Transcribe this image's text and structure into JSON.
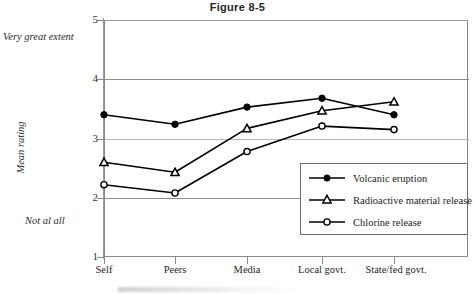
{
  "figure": {
    "title": "Figure 8-5"
  },
  "axes": {
    "y_title": "Mean rating",
    "y_ticks": [
      "5",
      "4",
      "3",
      "2",
      "1"
    ],
    "y_anchor_high": "Very great extent",
    "y_anchor_low": "Not al all",
    "x_ticks": [
      "Self",
      "Peers",
      "Media",
      "Local  govt.",
      "State/fed govt."
    ]
  },
  "legend": {
    "items": [
      {
        "label": "Volcanic eruption",
        "marker": "filled-circle",
        "color": "#000000"
      },
      {
        "label": "Radioactive material release",
        "marker": "open-triangle",
        "color": "#000000"
      },
      {
        "label": "Chlorine release",
        "marker": "open-circle",
        "color": "#000000"
      }
    ]
  },
  "chart_data": {
    "type": "line",
    "title": "Figure 8-5",
    "xlabel": "",
    "ylabel": "Mean rating",
    "ylim": [
      1,
      5
    ],
    "yticks": [
      1,
      2,
      3,
      4,
      5
    ],
    "grid": true,
    "legend_position": "inside-bottom-right",
    "annotations": [
      {
        "text": "Very great extent",
        "at_y": 5,
        "side": "left"
      },
      {
        "text": "Not al all",
        "at_y": 1.6,
        "side": "left"
      }
    ],
    "categories": [
      "Self",
      "Peers",
      "Media",
      "Local  govt.",
      "State/fed govt."
    ],
    "series": [
      {
        "name": "Volcanic eruption",
        "marker": "filled-circle",
        "values": [
          3.4,
          3.24,
          3.53,
          3.68,
          3.4
        ]
      },
      {
        "name": "Radioactive material release",
        "marker": "open-triangle",
        "values": [
          2.6,
          2.43,
          3.17,
          3.47,
          3.62
        ]
      },
      {
        "name": "Chlorine release",
        "marker": "open-circle",
        "values": [
          2.22,
          2.08,
          2.78,
          3.21,
          3.15
        ]
      }
    ]
  }
}
